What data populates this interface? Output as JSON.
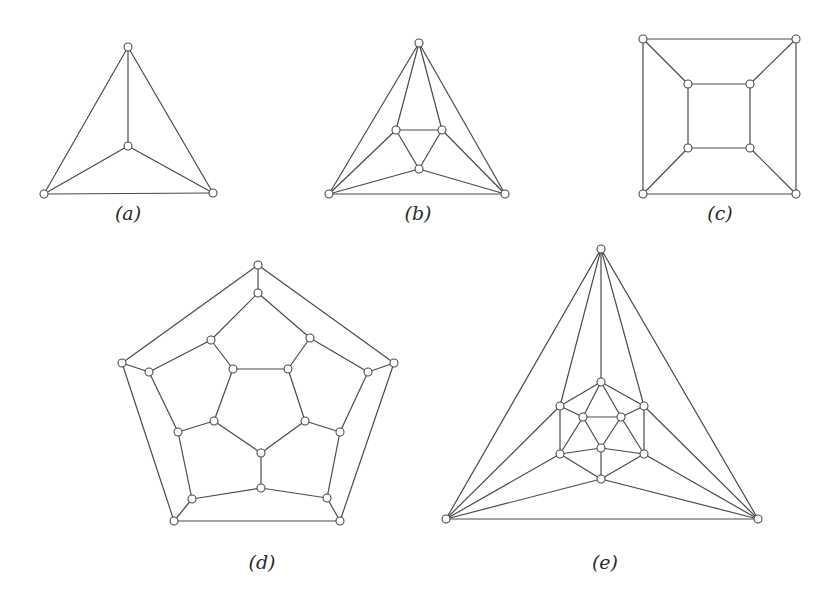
{
  "figure": {
    "node_radius": 4,
    "edge_color": "#4a4a4a",
    "node_fill": "#ffffff",
    "graphs": [
      {
        "id": "a",
        "label": "(a)",
        "name": "tetrahedron",
        "label_pos": [
          128,
          220
        ],
        "nodes": [
          [
            128,
            47
          ],
          [
            128,
            146
          ],
          [
            44,
            194
          ],
          [
            213,
            193
          ]
        ],
        "edges": [
          [
            0,
            1
          ],
          [
            0,
            2
          ],
          [
            0,
            3
          ],
          [
            1,
            2
          ],
          [
            1,
            3
          ],
          [
            2,
            3
          ]
        ]
      },
      {
        "id": "b",
        "label": "(b)",
        "name": "octahedron",
        "label_pos": [
          418,
          220
        ],
        "nodes": [
          [
            419,
            43
          ],
          [
            396,
            130
          ],
          [
            442,
            130
          ],
          [
            419,
            169
          ],
          [
            329,
            194
          ],
          [
            505,
            194
          ]
        ],
        "edges": [
          [
            0,
            1
          ],
          [
            0,
            2
          ],
          [
            0,
            4
          ],
          [
            0,
            5
          ],
          [
            1,
            2
          ],
          [
            1,
            3
          ],
          [
            2,
            3
          ],
          [
            1,
            4
          ],
          [
            2,
            5
          ],
          [
            3,
            4
          ],
          [
            3,
            5
          ],
          [
            4,
            5
          ]
        ]
      },
      {
        "id": "c",
        "label": "(c)",
        "name": "cube",
        "label_pos": [
          720,
          220
        ],
        "nodes": [
          [
            643,
            39
          ],
          [
            796,
            39
          ],
          [
            796,
            194
          ],
          [
            643,
            194
          ],
          [
            688,
            84
          ],
          [
            750,
            84
          ],
          [
            750,
            148
          ],
          [
            688,
            148
          ]
        ],
        "edges": [
          [
            0,
            1
          ],
          [
            1,
            2
          ],
          [
            2,
            3
          ],
          [
            3,
            0
          ],
          [
            4,
            5
          ],
          [
            5,
            6
          ],
          [
            6,
            7
          ],
          [
            7,
            4
          ],
          [
            0,
            4
          ],
          [
            1,
            5
          ],
          [
            2,
            6
          ],
          [
            3,
            7
          ]
        ]
      },
      {
        "id": "d",
        "label": "(d)",
        "name": "dodecahedron",
        "label_pos": [
          262,
          569
        ],
        "nodes": [
          [
            258,
            265
          ],
          [
            394,
            363
          ],
          [
            340,
            521
          ],
          [
            174,
            521
          ],
          [
            122,
            363
          ],
          [
            258,
            293
          ],
          [
            310,
            338
          ],
          [
            368,
            372
          ],
          [
            340,
            432
          ],
          [
            327,
            498
          ],
          [
            261,
            488
          ],
          [
            192,
            499
          ],
          [
            178,
            432
          ],
          [
            149,
            372
          ],
          [
            211,
            340
          ],
          [
            288,
            369
          ],
          [
            305,
            421
          ],
          [
            261,
            453
          ],
          [
            214,
            421
          ],
          [
            233,
            369
          ]
        ],
        "edges": [
          [
            0,
            1
          ],
          [
            1,
            2
          ],
          [
            2,
            3
          ],
          [
            3,
            4
          ],
          [
            4,
            0
          ],
          [
            0,
            5
          ],
          [
            1,
            7
          ],
          [
            2,
            9
          ],
          [
            3,
            11
          ],
          [
            4,
            13
          ],
          [
            5,
            6
          ],
          [
            6,
            7
          ],
          [
            7,
            8
          ],
          [
            8,
            9
          ],
          [
            9,
            10
          ],
          [
            10,
            11
          ],
          [
            11,
            12
          ],
          [
            12,
            13
          ],
          [
            13,
            14
          ],
          [
            14,
            5
          ],
          [
            6,
            15
          ],
          [
            8,
            16
          ],
          [
            10,
            17
          ],
          [
            12,
            18
          ],
          [
            14,
            19
          ],
          [
            15,
            16
          ],
          [
            16,
            17
          ],
          [
            17,
            18
          ],
          [
            18,
            19
          ],
          [
            19,
            15
          ]
        ]
      },
      {
        "id": "e",
        "label": "(e)",
        "name": "icosahedron",
        "label_pos": [
          605,
          569
        ],
        "nodes": [
          [
            601,
            249
          ],
          [
            446,
            519
          ],
          [
            758,
            519
          ],
          [
            601,
            382
          ],
          [
            560,
            406
          ],
          [
            644,
            406
          ],
          [
            560,
            454
          ],
          [
            644,
            454
          ],
          [
            601,
            479
          ],
          [
            583,
            417
          ],
          [
            621,
            417
          ],
          [
            601,
            448
          ]
        ],
        "edges": [
          [
            0,
            1
          ],
          [
            0,
            2
          ],
          [
            1,
            2
          ],
          [
            0,
            3
          ],
          [
            0,
            4
          ],
          [
            0,
            5
          ],
          [
            1,
            4
          ],
          [
            1,
            6
          ],
          [
            1,
            8
          ],
          [
            2,
            5
          ],
          [
            2,
            7
          ],
          [
            2,
            8
          ],
          [
            3,
            4
          ],
          [
            3,
            5
          ],
          [
            4,
            6
          ],
          [
            5,
            7
          ],
          [
            6,
            8
          ],
          [
            7,
            8
          ],
          [
            3,
            9
          ],
          [
            3,
            10
          ],
          [
            4,
            9
          ],
          [
            5,
            10
          ],
          [
            6,
            9
          ],
          [
            6,
            11
          ],
          [
            7,
            10
          ],
          [
            7,
            11
          ],
          [
            8,
            11
          ],
          [
            9,
            10
          ],
          [
            10,
            11
          ],
          [
            11,
            9
          ]
        ]
      }
    ]
  }
}
